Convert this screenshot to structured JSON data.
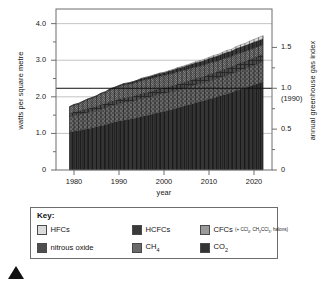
{
  "chart_data": {
    "type": "area",
    "title": "",
    "xlabel": "year",
    "ylabel": "watts per square metre",
    "y2label": "annual greenhouse gas index",
    "xlim": [
      1976,
      2024
    ],
    "ylim": [
      0,
      4.4
    ],
    "y2lim": [
      0,
      1.97
    ],
    "grid": true,
    "legend_position": "below",
    "stacked": true,
    "yticks": [
      0,
      0.5,
      1.0,
      1.5,
      2.0,
      2.5,
      3.0,
      3.5,
      4.0
    ],
    "ytick_labels": [
      "0",
      "",
      "1.0",
      "",
      "2.0",
      "",
      "3.0",
      "",
      "4.0"
    ],
    "y2ticks": [
      0,
      0.5,
      1.0,
      1.5
    ],
    "y2tick_labels": [
      "0",
      "0.5",
      "1.0",
      "1.5"
    ],
    "y2_annotation": "(1990)",
    "xticks": [
      1980,
      1990,
      2000,
      2010,
      2020
    ],
    "xtick_labels": [
      "1980",
      "1990",
      "2000",
      "2010",
      "2020"
    ],
    "reference_line": {
      "value": 1.0,
      "axis": "y2",
      "label": "1.0 (1990)"
    },
    "x": [
      1979,
      1980,
      1981,
      1982,
      1983,
      1984,
      1985,
      1986,
      1987,
      1988,
      1989,
      1990,
      1991,
      1992,
      1993,
      1994,
      1995,
      1996,
      1997,
      1998,
      1999,
      2000,
      2001,
      2002,
      2003,
      2004,
      2005,
      2006,
      2007,
      2008,
      2009,
      2010,
      2011,
      2012,
      2013,
      2014,
      2015,
      2016,
      2017,
      2018,
      2019,
      2020,
      2021,
      2022
    ],
    "series": [
      {
        "name": "CO2",
        "values": [
          1.03,
          1.06,
          1.08,
          1.1,
          1.13,
          1.15,
          1.18,
          1.21,
          1.24,
          1.28,
          1.31,
          1.34,
          1.36,
          1.38,
          1.4,
          1.43,
          1.46,
          1.49,
          1.51,
          1.55,
          1.58,
          1.6,
          1.63,
          1.66,
          1.7,
          1.73,
          1.77,
          1.8,
          1.84,
          1.87,
          1.9,
          1.94,
          1.97,
          2.01,
          2.05,
          2.08,
          2.12,
          2.17,
          2.21,
          2.25,
          2.29,
          2.33,
          2.37,
          2.41
        ]
      },
      {
        "name": "CH4",
        "values": [
          0.42,
          0.43,
          0.43,
          0.44,
          0.44,
          0.45,
          0.45,
          0.46,
          0.46,
          0.47,
          0.47,
          0.47,
          0.48,
          0.48,
          0.48,
          0.48,
          0.49,
          0.49,
          0.49,
          0.49,
          0.49,
          0.49,
          0.49,
          0.49,
          0.49,
          0.49,
          0.49,
          0.49,
          0.49,
          0.49,
          0.49,
          0.5,
          0.5,
          0.5,
          0.5,
          0.51,
          0.51,
          0.51,
          0.52,
          0.52,
          0.52,
          0.53,
          0.54,
          0.54
        ]
      },
      {
        "name": "nitrous oxide",
        "values": [
          0.1,
          0.1,
          0.1,
          0.11,
          0.11,
          0.11,
          0.11,
          0.12,
          0.12,
          0.12,
          0.12,
          0.13,
          0.13,
          0.13,
          0.13,
          0.14,
          0.14,
          0.14,
          0.14,
          0.15,
          0.15,
          0.15,
          0.15,
          0.16,
          0.16,
          0.16,
          0.16,
          0.17,
          0.17,
          0.17,
          0.17,
          0.18,
          0.18,
          0.18,
          0.19,
          0.19,
          0.19,
          0.2,
          0.2,
          0.2,
          0.21,
          0.21,
          0.21,
          0.22
        ]
      },
      {
        "name": "CFCs",
        "values": [
          0.17,
          0.19,
          0.2,
          0.22,
          0.24,
          0.25,
          0.27,
          0.29,
          0.3,
          0.32,
          0.33,
          0.34,
          0.35,
          0.35,
          0.35,
          0.35,
          0.35,
          0.35,
          0.35,
          0.34,
          0.34,
          0.34,
          0.34,
          0.33,
          0.33,
          0.33,
          0.32,
          0.32,
          0.31,
          0.31,
          0.31,
          0.3,
          0.3,
          0.29,
          0.29,
          0.29,
          0.28,
          0.28,
          0.27,
          0.27,
          0.26,
          0.26,
          0.25,
          0.25
        ]
      },
      {
        "name": "HCFCs",
        "values": [
          0.01,
          0.01,
          0.01,
          0.01,
          0.02,
          0.02,
          0.02,
          0.02,
          0.02,
          0.03,
          0.03,
          0.03,
          0.04,
          0.04,
          0.05,
          0.05,
          0.06,
          0.06,
          0.07,
          0.07,
          0.08,
          0.08,
          0.09,
          0.09,
          0.1,
          0.1,
          0.11,
          0.11,
          0.12,
          0.12,
          0.13,
          0.13,
          0.14,
          0.14,
          0.15,
          0.15,
          0.15,
          0.16,
          0.16,
          0.16,
          0.17,
          0.17,
          0.17,
          0.17
        ]
      },
      {
        "name": "HFCs",
        "values": [
          0.0,
          0.0,
          0.0,
          0.0,
          0.0,
          0.0,
          0.0,
          0.0,
          0.0,
          0.0,
          0.0,
          0.0,
          0.0,
          0.0,
          0.0,
          0.0,
          0.01,
          0.01,
          0.01,
          0.01,
          0.01,
          0.01,
          0.01,
          0.02,
          0.02,
          0.02,
          0.02,
          0.02,
          0.03,
          0.03,
          0.03,
          0.03,
          0.04,
          0.04,
          0.04,
          0.05,
          0.05,
          0.05,
          0.06,
          0.06,
          0.07,
          0.07,
          0.08,
          0.08
        ]
      }
    ],
    "totals": [
      1.73,
      1.79,
      1.82,
      1.88,
      1.94,
      1.98,
      2.03,
      2.1,
      2.14,
      2.22,
      2.26,
      2.31,
      2.36,
      2.38,
      2.41,
      2.45,
      2.51,
      2.54,
      2.57,
      2.61,
      2.65,
      2.67,
      2.71,
      2.75,
      2.8,
      2.83,
      2.87,
      2.91,
      2.96,
      2.99,
      3.03,
      3.08,
      3.13,
      3.16,
      3.22,
      3.27,
      3.3,
      3.37,
      3.42,
      3.46,
      3.52,
      3.57,
      3.62,
      3.67
    ],
    "colors": {
      "co2": "#343434",
      "ch4": "#6a6a6a",
      "n2o": "#4e4e4e",
      "cfcs": "#9a9a9a",
      "hcfcs": "#3a3a3a",
      "hfcs": "#dcdcdc",
      "axis": "#6d6d6d",
      "grid": "#b4b4b4",
      "text": "#161616"
    }
  },
  "axes": {
    "left_title": "watts per square metre",
    "right_title": "annual greenhouse gas index",
    "x_title": "year",
    "left_ticks": [
      "4.0",
      "3.0",
      "2.0",
      "1.0",
      "0"
    ],
    "right_ticks": [
      "1.5",
      "1.0",
      "0.5",
      "0"
    ],
    "right_annotation": "(1990)",
    "x_ticks": [
      "1980",
      "1990",
      "2000",
      "2010",
      "2020"
    ]
  },
  "legend": {
    "title": "Key:",
    "items": [
      {
        "label": "HFCs",
        "swatch": "hfcs-swatch",
        "note": ""
      },
      {
        "label": "HCFCs",
        "swatch": "hcfcs-swatch",
        "note": ""
      },
      {
        "label": "CFCs",
        "swatch": "cfcs-swatch",
        "note": "(+ CCl4, CH3CCl3, halons)"
      },
      {
        "label": "nitrous oxide",
        "swatch": "nitrous-oxide-swatch",
        "note": ""
      },
      {
        "label": "CH4",
        "swatch": "ch4-swatch",
        "note": ""
      },
      {
        "label": "CO2",
        "swatch": "co2-swatch",
        "note": ""
      }
    ]
  }
}
